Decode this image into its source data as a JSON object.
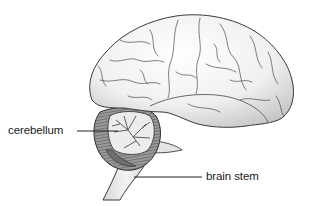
{
  "figure": {
    "labels": [
      {
        "id": "cerebellum",
        "text": "cerebellum"
      },
      {
        "id": "brain_stem",
        "text": "brain stem"
      }
    ]
  },
  "colors": {
    "outline": "#3a3a3a",
    "cerebrum_fill": "#f2f2f2",
    "cerebrum_shade": "#c8c8c8",
    "cerebellum_fill": "#8a8a8a",
    "cerebellum_inner": "#e6e6e6",
    "stem_fill": "#e8e8e8",
    "leader_line": "#222222"
  }
}
